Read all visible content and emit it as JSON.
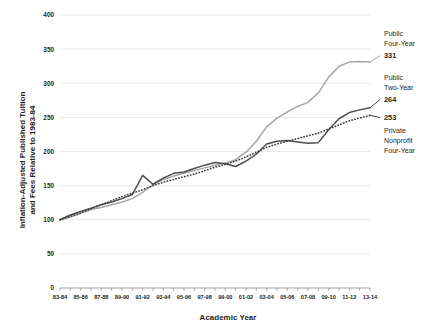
{
  "chart_data": {
    "type": "line",
    "title": "",
    "xlabel": "Academic Year",
    "ylabel": "Inflation-Adjusted Published Tuition and Fees Relative to 1983-84",
    "ylabel_line1": "Inflation-Adjusted Published Tuition",
    "ylabel_line2": "and Fees Relative to 1983-84",
    "ylim": [
      0,
      400
    ],
    "yticks": [
      0,
      50,
      100,
      150,
      200,
      250,
      300,
      350,
      400
    ],
    "grid": true,
    "legend_position": "right-inline-labels",
    "categories": [
      "83-84",
      "84-85",
      "85-86",
      "86-87",
      "87-88",
      "88-89",
      "89-90",
      "90-91",
      "91-92",
      "92-93",
      "93-94",
      "94-95",
      "95-96",
      "96-97",
      "97-98",
      "98-99",
      "99-00",
      "00-01",
      "01-02",
      "02-03",
      "03-04",
      "04-05",
      "05-06",
      "06-07",
      "07-08",
      "08-09",
      "09-10",
      "10-11",
      "11-12",
      "12-13",
      "13-14"
    ],
    "xtick_labels": [
      "83-84",
      "85-86",
      "87-88",
      "89-90",
      "91-92",
      "93-94",
      "95-96",
      "97-98",
      "99-00",
      "01-02",
      "03-04",
      "05-06",
      "07-08",
      "09-10",
      "11-12",
      "13-14"
    ],
    "series": [
      {
        "name": "Public Four-Year",
        "label_line1": "Public",
        "label_line2": "Four-Year",
        "end_value": 331,
        "color": "#a6a6a6",
        "style": "solid",
        "values": [
          100,
          104,
          109,
          115,
          118,
          122,
          126,
          131,
          140,
          152,
          159,
          164,
          168,
          172,
          176,
          180,
          183,
          188,
          199,
          215,
          236,
          249,
          258,
          266,
          272,
          286,
          309,
          325,
          331,
          332,
          331
        ]
      },
      {
        "name": "Public Two-Year",
        "label_line1": "Public",
        "label_line2": "Two-Year",
        "end_value": 264,
        "color": "#4d4d4d",
        "style": "solid",
        "values": [
          100,
          107,
          112,
          117,
          122,
          126,
          131,
          137,
          165,
          152,
          161,
          168,
          170,
          175,
          180,
          184,
          182,
          178,
          186,
          196,
          211,
          215,
          216,
          214,
          212,
          213,
          232,
          248,
          257,
          261,
          264
        ]
      },
      {
        "name": "Private Nonprofit Four-Year",
        "label_line1": "Private",
        "label_line2": "Nonprofit",
        "label_line3": "Four-Year",
        "end_value": 253,
        "color": "#3b3b3b",
        "style": "dotted",
        "values": [
          100,
          105,
          110,
          116,
          122,
          128,
          134,
          139,
          144,
          150,
          155,
          159,
          163,
          167,
          172,
          177,
          181,
          186,
          192,
          199,
          206,
          211,
          215,
          219,
          223,
          227,
          233,
          239,
          245,
          249,
          253
        ]
      }
    ]
  },
  "axis": {
    "x_title": "Academic Year"
  }
}
